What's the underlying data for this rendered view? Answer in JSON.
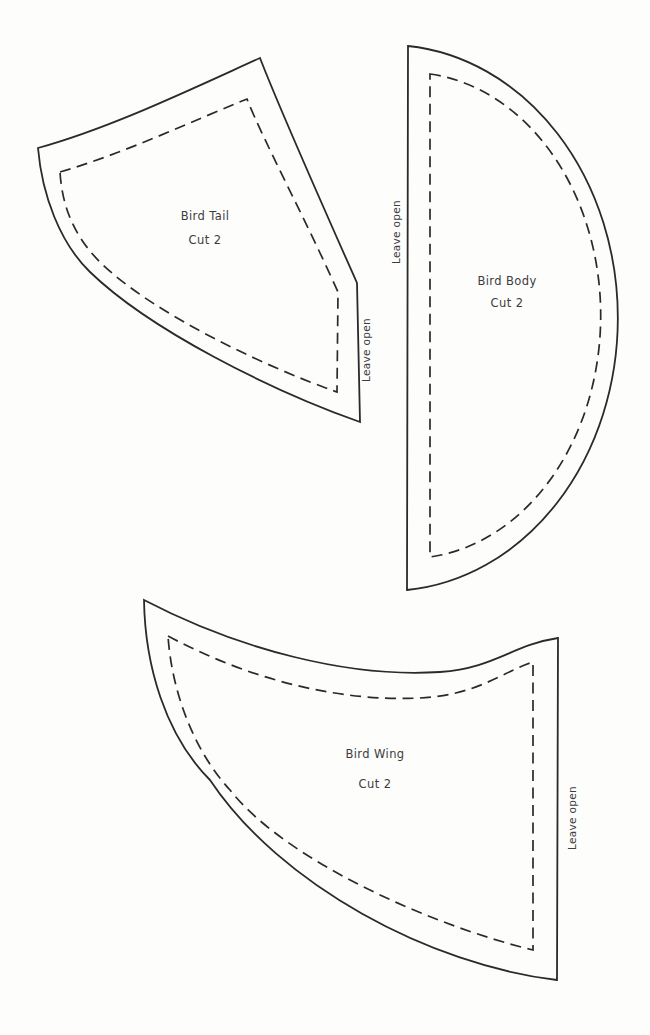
{
  "sheet": {
    "background_color": "#fdfdfc",
    "line_color": "#2a2a2a",
    "text_color": "#3c3c3c"
  },
  "pieces": [
    {
      "id": "bird-tail",
      "name": "Bird Tail",
      "cut": "Cut 2",
      "leave_open": "Leave open"
    },
    {
      "id": "bird-body",
      "name": "Bird Body",
      "cut": "Cut 2",
      "leave_open": "Leave open"
    },
    {
      "id": "bird-wing",
      "name": "Bird Wing",
      "cut": "Cut 2",
      "leave_open": "Leave open"
    }
  ]
}
